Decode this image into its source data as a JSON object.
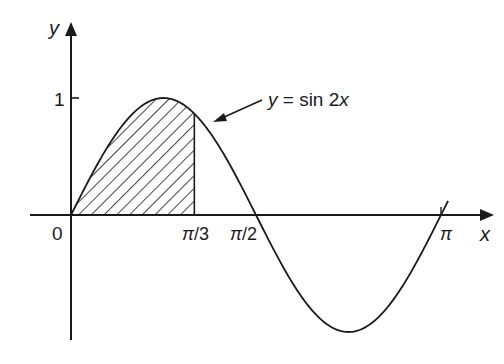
{
  "figure": {
    "curve_label": {
      "y": "y",
      "eq": " = sin 2",
      "x": "x"
    },
    "axes": {
      "x_label": "x",
      "y_label": "y",
      "origin_label": "0"
    },
    "ticks": {
      "y_one": "1",
      "x_pi3_sym": "π",
      "x_pi3_rest": "/3",
      "x_pi2_sym": "π",
      "x_pi2_rest": "/2",
      "x_pi": "π"
    },
    "colors": {
      "ink": "#1a1a1a",
      "background": "#ffffff"
    }
  },
  "chart_data": {
    "type": "line",
    "title": "",
    "function": "y = sin 2x",
    "xlabel": "x",
    "ylabel": "y",
    "x_ticks": [
      "0",
      "π/3",
      "π/2",
      "π"
    ],
    "y_ticks": [
      "1"
    ],
    "xlim": [
      0,
      3.14159
    ],
    "ylim": [
      -1,
      1
    ],
    "series": [
      {
        "name": "y = sin 2x",
        "x": [
          0,
          0.3927,
          0.7854,
          1.0472,
          1.1781,
          1.5708,
          1.9635,
          2.3562,
          2.7489,
          3.14159
        ],
        "values": [
          0,
          0.7071,
          1,
          0.866,
          0.7071,
          0,
          -0.7071,
          -1,
          -0.7071,
          0
        ]
      }
    ],
    "shaded_region": {
      "from": "0",
      "to": "π/3",
      "under": "y = sin 2x",
      "style": "hatched"
    },
    "annotations": [
      "y = sin 2x (arrow to curve)"
    ],
    "grid": false
  }
}
